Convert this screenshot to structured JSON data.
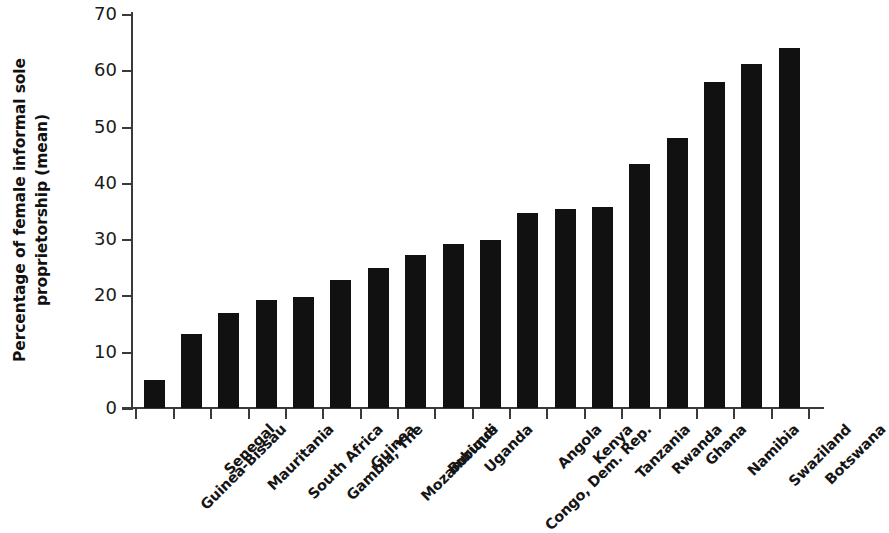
{
  "chart_data": {
    "type": "bar",
    "title": "",
    "subtitle": "",
    "xlabel": "",
    "ylabel_lines": [
      "Percentage of female informal sole",
      "proprietorship (mean)"
    ],
    "ylabel": "Percentage of female informal sole proprietorship (mean)",
    "ylim": [
      0,
      70
    ],
    "yticks": [
      0,
      10,
      20,
      30,
      40,
      50,
      60,
      70
    ],
    "ytick_labels": [
      "0",
      "10",
      "20",
      "30",
      "40",
      "50",
      "60",
      "70"
    ],
    "grid": false,
    "legend": false,
    "bar_color": "#111111",
    "axis_color": "#3a3a3a",
    "categories": [
      "Guinea-Bissau",
      "Senegal",
      "Mauritania",
      "South Africa",
      "Gambia, The",
      "Guinea",
      "Mozambique",
      "Burundi",
      "Uganda",
      "Congo, Dem. Rep.",
      "Angola",
      "Kenya",
      "Tanzania",
      "Rwanda",
      "Ghana",
      "Namibia",
      "Swaziland",
      "Botswana"
    ],
    "values": [
      5.0,
      13.2,
      16.8,
      19.2,
      19.8,
      22.8,
      24.8,
      27.2,
      29.2,
      29.8,
      34.6,
      35.4,
      35.7,
      43.4,
      47.9,
      58.0,
      61.1,
      64.0
    ]
  }
}
